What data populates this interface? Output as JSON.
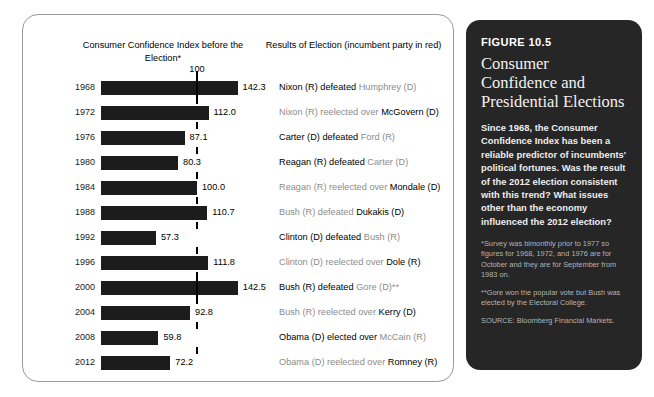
{
  "headers": {
    "left": "Consumer Confidence Index before the Election*",
    "right": "Results of Election (incumbent party in red)"
  },
  "axis": {
    "reference_label": "100",
    "reference_value": 100
  },
  "panel": {
    "figure_number": "FIGURE 10.5",
    "title": "Consumer Confidence and Presidential Elections",
    "body": "Since 1968, the Consumer Confidence Index has been a reliable predictor of incumbents' political fortunes. Was the result of the 2012 election consistent with this trend? What issues other than the economy influenced the 2012 election?",
    "note1": "*Survey was bimonthly prior to 1977 so figures for 1968, 1972, and 1976 are for October and they are for September from 1983 on.",
    "note2": "**Gore won the popular vote but Bush was elected by the Electoral College.",
    "source": "SOURCE: Bloomberg Financial Markets."
  },
  "chart_data": {
    "type": "bar",
    "title": "Consumer Confidence Index before the Election*",
    "xlabel": "Consumer Confidence Index",
    "ylabel": "Election year",
    "orientation": "horizontal",
    "xlim": [
      0,
      150
    ],
    "grid": false,
    "reference_line": 100,
    "categories": [
      "1968",
      "1972",
      "1976",
      "1980",
      "1984",
      "1988",
      "1992",
      "1996",
      "2000",
      "2004",
      "2008",
      "2012"
    ],
    "values": [
      142.3,
      112.0,
      87.1,
      80.3,
      100.0,
      110.7,
      57.3,
      111.8,
      142.5,
      92.8,
      59.8,
      72.2
    ],
    "rows": [
      {
        "year": "1968",
        "value": 142.3,
        "value_label": "142.3",
        "winner": "Nixon (R) defeated ",
        "loser": "Humphrey (D)",
        "incumbent_side": "loser"
      },
      {
        "year": "1972",
        "value": 112.0,
        "value_label": "112.0",
        "winner": "Nixon (R) reelected over ",
        "loser": "McGovern (D)",
        "incumbent_side": "winner"
      },
      {
        "year": "1976",
        "value": 87.1,
        "value_label": "87.1",
        "winner": "Carter (D) defeated ",
        "loser": "Ford (R)",
        "incumbent_side": "loser"
      },
      {
        "year": "1980",
        "value": 80.3,
        "value_label": "80.3",
        "winner": "Reagan (R) defeated ",
        "loser": "Carter (D)",
        "incumbent_side": "loser"
      },
      {
        "year": "1984",
        "value": 100.0,
        "value_label": "100.0",
        "winner": "Reagan (R) reelected over ",
        "loser": "Mondale (D)",
        "incumbent_side": "winner"
      },
      {
        "year": "1988",
        "value": 110.7,
        "value_label": "110.7",
        "winner": "Bush (R) defeated ",
        "loser": "Dukakis (D)",
        "incumbent_side": "winner"
      },
      {
        "year": "1992",
        "value": 57.3,
        "value_label": "57.3",
        "winner": "Clinton (D) defeated ",
        "loser": "Bush (R)",
        "incumbent_side": "loser"
      },
      {
        "year": "1996",
        "value": 111.8,
        "value_label": "111.8",
        "winner": "Clinton (D) reelected over ",
        "loser": "Dole (R)",
        "incumbent_side": "winner"
      },
      {
        "year": "2000",
        "value": 142.5,
        "value_label": "142.5",
        "winner": "Bush (R) defeated ",
        "loser": "Gore (D)**",
        "incumbent_side": "loser"
      },
      {
        "year": "2004",
        "value": 92.8,
        "value_label": "92.8",
        "winner": "Bush (R) reelected over ",
        "loser": "Kerry (D)",
        "incumbent_side": "winner"
      },
      {
        "year": "2008",
        "value": 59.8,
        "value_label": "59.8",
        "winner": "Obama (D) elected over ",
        "loser": "McCain (R)",
        "incumbent_side": "loser"
      },
      {
        "year": "2012",
        "value": 72.2,
        "value_label": "72.2",
        "winner": "Obama (D) reelected over ",
        "loser": "Romney (R)",
        "incumbent_side": "winner"
      }
    ]
  }
}
